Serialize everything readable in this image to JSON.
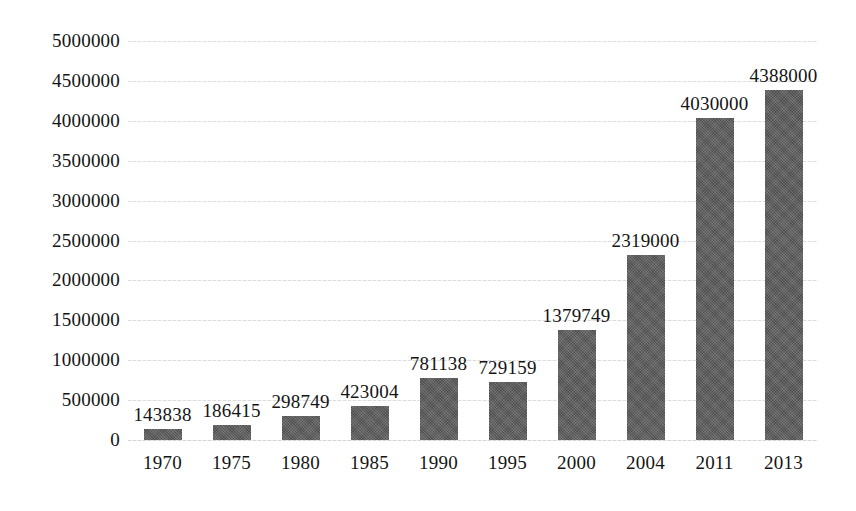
{
  "chart_data": {
    "type": "bar",
    "title": "",
    "subtitle": "",
    "xlabel": "",
    "ylabel": "",
    "categories": [
      "1970",
      "1975",
      "1980",
      "1985",
      "1990",
      "1995",
      "2000",
      "2004",
      "2011",
      "2013"
    ],
    "values": [
      143838,
      186415,
      298749,
      423004,
      781138,
      729159,
      1379749,
      2319000,
      4030000,
      4388000
    ],
    "data_labels": [
      "143838",
      "186415",
      "298749",
      "423004",
      "781138",
      "729159",
      "1379749",
      "2319000",
      "4030000",
      "4388000"
    ],
    "ylim": [
      0,
      5000000
    ],
    "ytick_values": [
      0,
      500000,
      1000000,
      1500000,
      2000000,
      2500000,
      3000000,
      3500000,
      4000000,
      4500000,
      5000000
    ],
    "ytick_labels": [
      "0",
      "500000",
      "1000000",
      "1500000",
      "2000000",
      "2500000",
      "3000000",
      "3500000",
      "4000000",
      "4500000",
      "5000000"
    ],
    "grid": true,
    "grid_axis": "y",
    "legend": false,
    "legend_position": "none",
    "series": [
      {
        "name": "",
        "values": [
          143838,
          186415,
          298749,
          423004,
          781138,
          729159,
          1379749,
          2319000,
          4030000,
          4388000
        ],
        "color": "#595959"
      }
    ],
    "colors": {
      "bar": "#595959",
      "gridline": "#dcdcdc",
      "text": "#141414",
      "background": "#ffffff"
    }
  }
}
